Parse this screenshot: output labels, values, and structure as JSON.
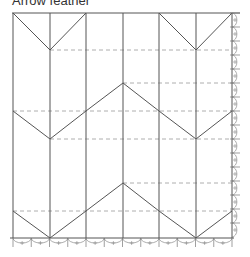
{
  "title": "Arrow feather",
  "colors": {
    "line": "#555555",
    "dashed": "#9a9a9a",
    "marks": "#777777",
    "background": "#ffffff"
  },
  "frame": {
    "left": 13,
    "right": 232,
    "top": 13,
    "bottom": 238
  },
  "columns_x": [
    13,
    50,
    86,
    123,
    159,
    196,
    232
  ],
  "chevrons": [
    {
      "name": "top-left-chevron",
      "points": [
        [
          13,
          13
        ],
        [
          50,
          50
        ],
        [
          86,
          13
        ]
      ]
    },
    {
      "name": "top-right-chevron",
      "points": [
        [
          159,
          13
        ],
        [
          196,
          50
        ],
        [
          232,
          13
        ]
      ]
    },
    {
      "name": "middle-zigzag",
      "points": [
        [
          13,
          111
        ],
        [
          50,
          139
        ],
        [
          86,
          111
        ],
        [
          123,
          83
        ],
        [
          159,
          111
        ],
        [
          196,
          139
        ],
        [
          232,
          111
        ]
      ]
    },
    {
      "name": "bottom-zigzag",
      "points": [
        [
          13,
          211
        ],
        [
          50,
          238
        ],
        [
          86,
          211
        ],
        [
          123,
          183
        ],
        [
          159,
          211
        ],
        [
          196,
          238
        ],
        [
          232,
          211
        ]
      ]
    }
  ],
  "dashed_lines": [
    {
      "y": 50,
      "x1": 50,
      "x2": 232
    },
    {
      "y": 83,
      "x1": 123,
      "x2": 232
    },
    {
      "y": 111,
      "x1": 13,
      "x2": 232
    },
    {
      "y": 139,
      "x1": 50,
      "x2": 232
    },
    {
      "y": 183,
      "x1": 123,
      "x2": 232
    },
    {
      "y": 211,
      "x1": 13,
      "x2": 232
    }
  ]
}
